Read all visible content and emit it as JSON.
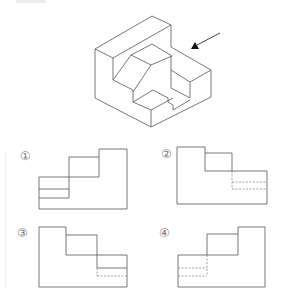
{
  "problem": {
    "viewing_arrow": {
      "color": "#111111",
      "line": [
        220,
        33,
        197,
        45
      ],
      "head": [
        [
          191,
          49
        ],
        [
          199,
          49
        ],
        [
          195,
          42
        ]
      ]
    },
    "isometric_lines": [
      [
        152,
        16,
        171,
        25
      ],
      [
        152,
        16,
        95,
        49
      ],
      [
        95,
        49,
        113,
        58
      ],
      [
        171,
        25,
        113,
        58
      ],
      [
        95,
        49,
        95,
        98
      ],
      [
        113,
        58,
        113,
        80
      ],
      [
        171,
        25,
        171,
        47
      ],
      [
        131,
        55,
        152,
        44
      ],
      [
        152,
        44,
        172,
        56
      ],
      [
        131,
        55,
        151,
        65
      ],
      [
        151,
        65,
        172,
        56
      ],
      [
        113,
        80,
        131,
        55
      ],
      [
        113,
        80,
        133,
        90
      ],
      [
        151,
        65,
        133,
        92
      ],
      [
        133,
        90,
        133,
        102
      ],
      [
        171,
        47,
        211,
        70
      ],
      [
        171,
        56,
        171,
        88
      ],
      [
        171,
        70,
        190,
        82
      ],
      [
        190,
        82,
        211,
        70
      ],
      [
        190,
        82,
        190,
        98
      ],
      [
        211,
        70,
        211,
        97
      ],
      [
        211,
        97,
        151,
        127
      ],
      [
        95,
        98,
        151,
        127
      ],
      [
        151,
        110,
        151,
        127
      ],
      [
        133,
        102,
        153,
        90
      ],
      [
        153,
        90,
        168,
        98
      ],
      [
        168,
        98,
        168,
        102
      ],
      [
        168,
        102,
        173,
        105
      ],
      [
        173,
        105,
        173,
        110
      ],
      [
        173,
        110,
        190,
        100
      ],
      [
        171,
        88,
        190,
        98
      ],
      [
        133,
        102,
        151,
        110
      ],
      [
        151,
        110,
        173,
        98
      ]
    ]
  },
  "options": [
    {
      "label": "①",
      "label_pos": [
        20,
        150
      ],
      "solid": [
        [
          39,
          177,
          69,
          177
        ],
        [
          69,
          177,
          69,
          157
        ],
        [
          69,
          157,
          99,
          157
        ],
        [
          99,
          157,
          99,
          149
        ],
        [
          99,
          149,
          127,
          149
        ],
        [
          127,
          149,
          127,
          209
        ],
        [
          127,
          209,
          39,
          209
        ],
        [
          39,
          209,
          39,
          177
        ],
        [
          39,
          189,
          69,
          189
        ],
        [
          39,
          198,
          69,
          198
        ],
        [
          69,
          177,
          69,
          198
        ],
        [
          69,
          177,
          99,
          177
        ],
        [
          99,
          157,
          99,
          177
        ]
      ],
      "dashed": []
    },
    {
      "label": "②",
      "label_pos": [
        161,
        148
      ],
      "solid": [
        [
          177,
          147,
          205,
          147
        ],
        [
          205,
          147,
          205,
          153
        ],
        [
          205,
          153,
          232,
          153
        ],
        [
          232,
          153,
          232,
          171
        ],
        [
          232,
          171,
          267,
          171
        ],
        [
          267,
          171,
          267,
          204
        ],
        [
          267,
          204,
          177,
          204
        ],
        [
          177,
          204,
          177,
          147
        ],
        [
          205,
          153,
          205,
          171
        ],
        [
          205,
          171,
          232,
          171
        ]
      ],
      "dashed": [
        [
          232,
          182,
          267,
          182
        ],
        [
          232,
          189,
          267,
          189
        ],
        [
          232,
          171,
          232,
          189
        ]
      ]
    },
    {
      "label": "③",
      "label_pos": [
        17,
        227
      ],
      "solid": [
        [
          39,
          227,
          66,
          227
        ],
        [
          66,
          227,
          66,
          235
        ],
        [
          66,
          235,
          97,
          235
        ],
        [
          97,
          235,
          97,
          255
        ],
        [
          97,
          255,
          127,
          255
        ],
        [
          127,
          255,
          127,
          287
        ],
        [
          127,
          287,
          39,
          287
        ],
        [
          39,
          287,
          39,
          227
        ],
        [
          66,
          235,
          66,
          255
        ],
        [
          66,
          255,
          97,
          255
        ],
        [
          97,
          268,
          127,
          268
        ],
        [
          97,
          255,
          97,
          268
        ]
      ],
      "dashed": [
        [
          97,
          276,
          127,
          276
        ],
        [
          97,
          268,
          97,
          276
        ]
      ]
    },
    {
      "label": "④",
      "label_pos": [
        159,
        227
      ],
      "solid": [
        [
          178,
          255,
          207,
          255
        ],
        [
          207,
          255,
          207,
          234
        ],
        [
          207,
          234,
          238,
          234
        ],
        [
          238,
          234,
          238,
          227
        ],
        [
          238,
          227,
          265,
          227
        ],
        [
          265,
          227,
          265,
          287
        ],
        [
          265,
          287,
          178,
          287
        ],
        [
          178,
          287,
          178,
          255
        ],
        [
          207,
          255,
          238,
          255
        ],
        [
          238,
          234,
          238,
          255
        ]
      ],
      "dashed": [
        [
          178,
          268,
          207,
          268
        ],
        [
          178,
          276,
          207,
          276
        ],
        [
          207,
          255,
          207,
          276
        ]
      ]
    }
  ],
  "colors": {
    "line": "#555555",
    "dashed": "#888888",
    "label": "#777777"
  }
}
